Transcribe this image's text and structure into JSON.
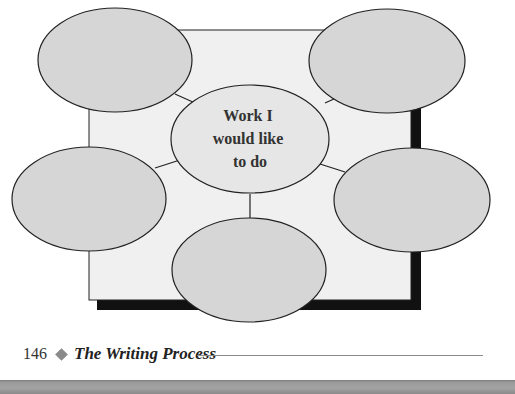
{
  "diagram": {
    "type": "cluster-web",
    "center_label_lines": [
      "Work I",
      "would like",
      "to do"
    ],
    "outer_bubbles": [
      {
        "position": "top-left",
        "label": ""
      },
      {
        "position": "top-right",
        "label": ""
      },
      {
        "position": "left",
        "label": ""
      },
      {
        "position": "right",
        "label": ""
      },
      {
        "position": "bottom",
        "label": ""
      }
    ],
    "colors": {
      "background_square": "#f0f0f0",
      "bubble_fill": "#d6d6d6",
      "center_fill": "#e6e6e6",
      "shadow": "#111111",
      "stroke": "#222222"
    }
  },
  "footer": {
    "page_number": "146",
    "separator": "diamond-icon",
    "section_title": "The Writing Process"
  }
}
